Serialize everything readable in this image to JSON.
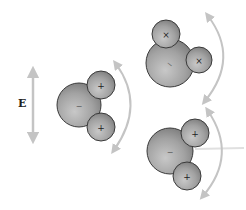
{
  "diagram": {
    "field_label": "E",
    "colors": {
      "atom_fill": "#9a9a9a",
      "atom_stroke": "#3a3a3a",
      "arrow": "#c4c4c4",
      "sign": "#222222"
    },
    "molecules": [
      {
        "id": "left",
        "oxygen_sign": "−",
        "hydrogen_signs": [
          "+",
          "+"
        ]
      },
      {
        "id": "top-right",
        "oxygen_sign": "−",
        "hydrogen_signs": [
          "+",
          "+"
        ]
      },
      {
        "id": "bottom-right",
        "oxygen_sign": "−",
        "hydrogen_signs": [
          "+",
          "+"
        ]
      }
    ]
  }
}
